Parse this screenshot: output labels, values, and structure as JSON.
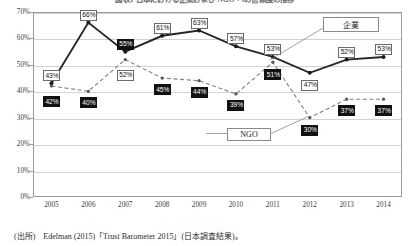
{
  "chart_data": {
    "type": "line",
    "title": "図表1 日本における企業および NGO への信頼度の推移",
    "xlabel": "",
    "ylabel": "",
    "x": [
      "2005",
      "2006",
      "2007",
      "2008",
      "2009",
      "2010",
      "2011",
      "2012",
      "2013",
      "2014"
    ],
    "categories": [
      "2005",
      "2006",
      "2007",
      "2008",
      "2009",
      "2010",
      "2011",
      "2012",
      "2013",
      "2014"
    ],
    "ylim": [
      0,
      70
    ],
    "ytick_labels": [
      "0%",
      "10%",
      "20%",
      "30%",
      "40%",
      "50%",
      "60%",
      "70%"
    ],
    "ytick_values": [
      0,
      10,
      20,
      30,
      40,
      50,
      60,
      70
    ],
    "grid": true,
    "legend_position": "annotation-callouts",
    "series": [
      {
        "name": "企業",
        "style": "solid",
        "values": [
          43,
          66,
          55,
          61,
          63,
          57,
          53,
          47,
          52,
          53
        ],
        "labels": [
          "43%",
          "66%",
          "55%",
          "61%",
          "63%",
          "57%",
          "53%",
          "47%",
          "52%",
          "53%"
        ],
        "label_styles": [
          "light",
          "light",
          "dark",
          "light",
          "light",
          "light",
          "light",
          "light",
          "light",
          "light"
        ]
      },
      {
        "name": "NGO",
        "style": "dashed",
        "values": [
          42,
          40,
          52,
          45,
          44,
          39,
          51,
          30,
          37,
          37
        ],
        "labels": [
          "42%",
          "40%",
          "52%",
          "45%",
          "44%",
          "39%",
          "51%",
          "30%",
          "37%",
          "37%"
        ],
        "label_styles": [
          "dark",
          "dark",
          "light",
          "dark",
          "dark",
          "dark",
          "dark",
          "dark",
          "dark",
          "dark"
        ]
      }
    ],
    "annotations": [
      {
        "name": "企業",
        "text": "企業"
      },
      {
        "name": "NGO",
        "text": "NGO"
      }
    ]
  },
  "source": {
    "text": "(出所)　Edelman (2015)「Trust Barometer 2015」(日本調査結果)。"
  }
}
